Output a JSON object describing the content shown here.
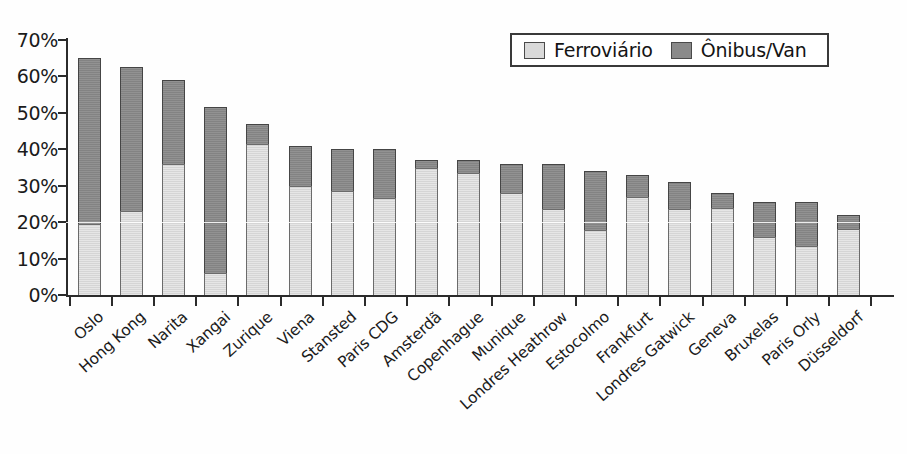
{
  "chart_data": {
    "type": "bar",
    "subtype": "stacked-vertical",
    "title": "",
    "subtitle": "",
    "xlabel": "",
    "ylabel": "",
    "ylim": [
      0,
      70
    ],
    "ytick_step": 10,
    "ytick_labels": [
      "0%",
      "10%",
      "20%",
      "30%",
      "40%",
      "50%",
      "60%",
      "70%"
    ],
    "ytick_values": [
      0,
      10,
      20,
      30,
      40,
      50,
      60,
      70
    ],
    "grid": false,
    "legend_position": "top-right",
    "value_unit": "%",
    "categories": [
      "Oslo",
      "Hong Kong",
      "Narita",
      "Xangai",
      "Zurique",
      "Viena",
      "Stansted",
      "Paris CDG",
      "Amsterdã",
      "Copenhague",
      "Munique",
      "Londres Heathrow",
      "Estocolmo",
      "Frankfurt",
      "Londres Gatwick",
      "Geneva",
      "Bruxelas",
      "Paris Orly",
      "Düsseldorf"
    ],
    "series": [
      {
        "name": "Ferroviário",
        "color": "#d9d9d9",
        "values": [
          19.5,
          23.0,
          36.0,
          6.0,
          41.5,
          30.0,
          28.5,
          26.5,
          35.0,
          33.5,
          28.0,
          23.5,
          17.8,
          27.0,
          23.5,
          24.0,
          16.0,
          13.5,
          18.0
        ]
      },
      {
        "name": "Ônibus/Van",
        "color": "#8a8a8a",
        "values": [
          45.5,
          39.5,
          23.0,
          45.5,
          5.5,
          11.0,
          11.5,
          13.5,
          2.0,
          3.5,
          8.0,
          12.5,
          16.2,
          6.0,
          7.5,
          4.0,
          9.5,
          12.0,
          4.0
        ]
      }
    ],
    "totals": [
      65.0,
      62.5,
      59.0,
      51.5,
      47.0,
      41.0,
      40.0,
      40.0,
      37.0,
      37.0,
      36.0,
      36.0,
      34.0,
      33.0,
      31.0,
      28.0,
      25.5,
      25.5,
      22.0
    ]
  },
  "legend": {
    "items": [
      {
        "label": "Ferroviário",
        "swatch": "light-gray-swatch"
      },
      {
        "label": "Ônibus/Van",
        "swatch": "dark-gray-swatch"
      }
    ]
  }
}
